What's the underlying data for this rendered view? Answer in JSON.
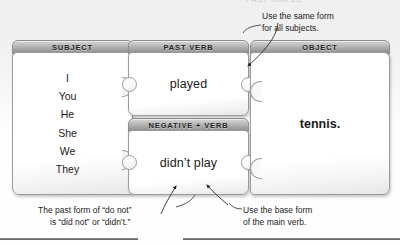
{
  "page": {
    "clipped_heading": "PAST SIMPLE"
  },
  "cards": {
    "subject": {
      "header": "SUBJECT",
      "items": [
        "I",
        "You",
        "He",
        "She",
        "We",
        "They"
      ]
    },
    "past_verb": {
      "header": "PAST VERB",
      "value": "played"
    },
    "negative_verb": {
      "header": "NEGATIVE + VERB",
      "value": "didn’t play"
    },
    "object": {
      "header": "OBJECT",
      "value": "tennis."
    }
  },
  "callouts": {
    "same_form": {
      "line1": "Use the same form",
      "line2": "for all subjects."
    },
    "past_form": {
      "line1": "The past form of “do not”",
      "line2": "is “did not” or “didn’t.”"
    },
    "base_form": {
      "line1": "Use the base form",
      "line2": "of the main verb."
    }
  },
  "colors": {
    "header_bar": "#b9b9b9",
    "card_body": "#ffffff",
    "outline": "#9b9b9b",
    "text": "#1a1a1a",
    "rule": "#5d5d5d"
  }
}
